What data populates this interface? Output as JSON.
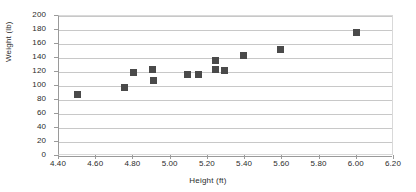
{
  "chart_data": {
    "type": "scatter",
    "title": "",
    "xlabel": "Height (ft)",
    "ylabel": "Weight (lb)",
    "xlim": [
      4.4,
      6.2
    ],
    "ylim": [
      0,
      200
    ],
    "xticks": [
      "4.40",
      "4.60",
      "4.80",
      "5.00",
      "5.20",
      "5.40",
      "5.60",
      "5.80",
      "6.00",
      "6.20"
    ],
    "yticks": [
      "0",
      "20",
      "40",
      "60",
      "80",
      "100",
      "120",
      "140",
      "160",
      "180",
      "200"
    ],
    "xtick_values": [
      4.4,
      4.6,
      4.8,
      5.0,
      5.2,
      5.4,
      5.6,
      5.8,
      6.0,
      6.2
    ],
    "ytick_values": [
      0,
      20,
      40,
      60,
      80,
      100,
      120,
      140,
      160,
      180,
      200
    ],
    "grid": "horizontal",
    "legend": "none",
    "marker": "square",
    "marker_color": "#4a4a4a",
    "series": [
      {
        "name": "Height vs Weight",
        "points": [
          {
            "x": 4.5,
            "y": 88
          },
          {
            "x": 4.75,
            "y": 98
          },
          {
            "x": 4.8,
            "y": 119
          },
          {
            "x": 4.9,
            "y": 123
          },
          {
            "x": 4.91,
            "y": 108
          },
          {
            "x": 5.09,
            "y": 116
          },
          {
            "x": 5.15,
            "y": 116
          },
          {
            "x": 5.24,
            "y": 137
          },
          {
            "x": 5.24,
            "y": 124
          },
          {
            "x": 5.29,
            "y": 122
          },
          {
            "x": 5.39,
            "y": 143
          },
          {
            "x": 5.59,
            "y": 152
          },
          {
            "x": 6.0,
            "y": 176
          }
        ]
      }
    ]
  },
  "axes": {
    "x_title": "Height (ft)",
    "y_title": "Weight (lb)"
  }
}
